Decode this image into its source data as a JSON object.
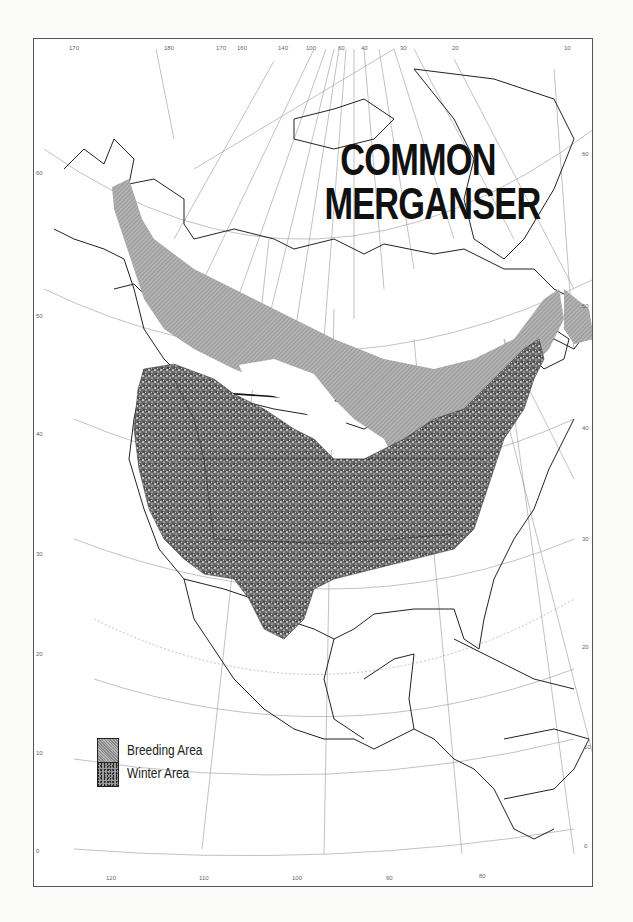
{
  "map": {
    "title_line1": "COMMON",
    "title_line2": "MERGANSER",
    "legend": [
      {
        "label": "Breeding Area",
        "pattern": "fine-hatch",
        "color": "#9f9f9f"
      },
      {
        "label": "Winter Area",
        "pattern": "stipple",
        "color": "#4a4a4a"
      }
    ],
    "top_longitude_labels": [
      "170",
      "180",
      "170",
      "160",
      "140",
      "100",
      "60",
      "40",
      "30",
      "20",
      "10"
    ],
    "bottom_longitude_labels": [
      "120",
      "110",
      "100",
      "90",
      "80"
    ],
    "left_latitude_labels": [
      "60",
      "50",
      "40",
      "30",
      "20",
      "10",
      "0"
    ],
    "right_latitude_labels": [
      "60",
      "50",
      "40",
      "30",
      "20",
      "10",
      "0"
    ],
    "colors": {
      "breeding": "#a3a3a3",
      "winter": "#4d4d4d",
      "land_outline": "#222222",
      "graticule": "#8a8a8a",
      "background": "#ffffff"
    }
  }
}
